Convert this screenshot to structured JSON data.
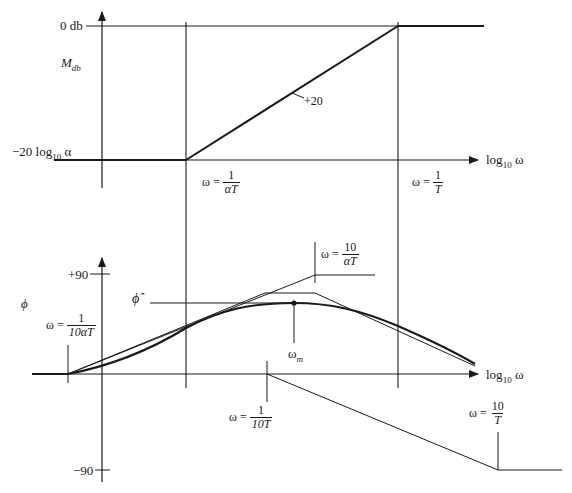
{
  "magnitude_plot": {
    "y_label_main": "M",
    "y_label_sub": "db",
    "top_level_label": "0 db",
    "bottom_level_label_prefix": "−20 log",
    "bottom_level_label_sub": "10",
    "bottom_level_label_suffix": " α",
    "slope_label": "+20",
    "x_axis_label_prefix": "log",
    "x_axis_label_sub": "10",
    "x_axis_label_suffix": " ω",
    "corner1": {
      "lhs": "ω =",
      "num": "1",
      "den": "αT"
    },
    "corner2": {
      "lhs": "ω =",
      "num": "1",
      "den": "T"
    }
  },
  "phase_plot": {
    "y_label": "ϕ",
    "tick_plus90": "+90",
    "tick_minus90": "−90",
    "phi_max_label": "ϕ̂",
    "omega_m_main": "ω",
    "omega_m_sub": "m",
    "x_axis_label_prefix": "log",
    "x_axis_label_sub": "10",
    "x_axis_label_suffix": " ω",
    "break1": {
      "lhs": "ω =",
      "num": "1",
      "den": "10αT"
    },
    "break2": {
      "lhs": "ω =",
      "num": "10",
      "den": "αT"
    },
    "break3": {
      "lhs": "ω =",
      "num": "1",
      "den": "10T"
    },
    "break4": {
      "lhs": "ω =",
      "num": "10",
      "den": "T"
    }
  },
  "colors": {
    "ink": "#1a1a1a",
    "background": "#ffffff"
  }
}
